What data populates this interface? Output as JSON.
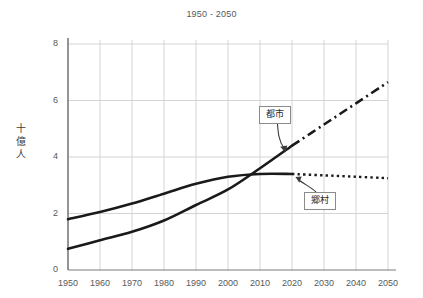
{
  "chart": {
    "subtitle": "1950 - 2050",
    "y_axis_title_chars": [
      "十",
      "億",
      "人"
    ],
    "callouts": {
      "urban": "都市",
      "rural": "郷村"
    }
  },
  "chart_data": {
    "type": "line",
    "title": "",
    "subtitle": "1950 - 2050",
    "xlabel": "",
    "ylabel": "十億人",
    "xlim": [
      1950,
      2050
    ],
    "ylim": [
      0,
      8
    ],
    "xticks": [
      1950,
      1960,
      1970,
      1980,
      1990,
      2000,
      2010,
      2020,
      2030,
      2040,
      2050
    ],
    "yticks": [
      0,
      2,
      4,
      6,
      8
    ],
    "grid": true,
    "legend": "annotations",
    "annotations": [
      {
        "label": "都市",
        "target_x": 2020,
        "target_y": 4.35
      },
      {
        "label": "郷村",
        "target_x": 2022,
        "target_y": 3.4
      }
    ],
    "series": [
      {
        "name": "都市",
        "label": "都市",
        "color": "#1a1a1a",
        "historical_style": "solid",
        "projection_style": "dash-dot",
        "projection_start_year": 2020,
        "x": [
          1950,
          1960,
          1970,
          1980,
          1990,
          2000,
          2010,
          2020,
          2030,
          2040,
          2050
        ],
        "values": [
          0.75,
          1.05,
          1.35,
          1.75,
          2.3,
          2.85,
          3.6,
          4.4,
          5.15,
          5.9,
          6.65
        ]
      },
      {
        "name": "郷村",
        "label": "郷村",
        "color": "#1a1a1a",
        "historical_style": "solid",
        "projection_style": "dotted",
        "projection_start_year": 2020,
        "x": [
          1950,
          1960,
          1970,
          1980,
          1990,
          2000,
          2010,
          2020,
          2030,
          2040,
          2050
        ],
        "values": [
          1.8,
          2.05,
          2.35,
          2.7,
          3.05,
          3.3,
          3.4,
          3.4,
          3.35,
          3.3,
          3.25
        ]
      }
    ],
    "crossover_year": 2009,
    "crossover_value": 3.35
  }
}
